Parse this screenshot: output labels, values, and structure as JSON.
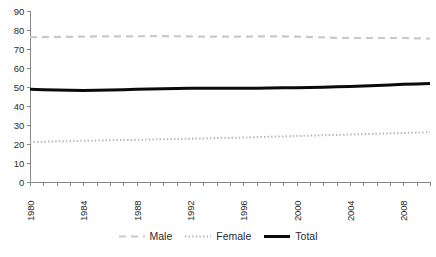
{
  "chart_data": {
    "type": "line",
    "title": "",
    "xlabel": "",
    "ylabel": "",
    "ylim": [
      0,
      90
    ],
    "xlim": [
      1980,
      2010
    ],
    "grid": false,
    "legend_position": "bottom",
    "ytick_labels": [
      "90",
      "80",
      "70",
      "60",
      "50",
      "40",
      "30",
      "20",
      "10",
      "0"
    ],
    "ytick_values": [
      90,
      80,
      70,
      60,
      50,
      40,
      30,
      20,
      10,
      0
    ],
    "x": [
      1980,
      1981,
      1982,
      1983,
      1984,
      1985,
      1986,
      1987,
      1988,
      1989,
      1990,
      1991,
      1992,
      1993,
      1994,
      1995,
      1996,
      1997,
      1998,
      1999,
      2000,
      2001,
      2002,
      2003,
      2004,
      2005,
      2006,
      2007,
      2008,
      2009,
      2010
    ],
    "xtick_labels": [
      "1980",
      "1984",
      "1988",
      "1992",
      "1996",
      "2000",
      "2004",
      "2008"
    ],
    "xtick_label_values": [
      1980,
      1984,
      1988,
      1992,
      1996,
      2000,
      2004,
      2008
    ],
    "xtick_rotation": 90,
    "series": [
      {
        "name": "Male",
        "style": "dashed",
        "color": "#c9c9c9",
        "width": 2.2,
        "values": [
          76.2,
          76.3,
          76.4,
          76.4,
          76.5,
          76.6,
          76.6,
          76.6,
          76.7,
          76.8,
          76.8,
          76.7,
          76.6,
          76.5,
          76.5,
          76.5,
          76.5,
          76.6,
          76.6,
          76.6,
          76.5,
          76.3,
          76.1,
          75.9,
          75.8,
          75.8,
          75.8,
          75.8,
          75.8,
          75.6,
          75.5
        ]
      },
      {
        "name": "Female",
        "style": "dotted",
        "color": "#b5b5b5",
        "width": 2.0,
        "values": [
          21.0,
          21.2,
          21.4,
          21.5,
          21.7,
          21.8,
          22.0,
          22.1,
          22.2,
          22.4,
          22.5,
          22.6,
          22.8,
          22.9,
          23.1,
          23.2,
          23.4,
          23.6,
          23.8,
          24.0,
          24.2,
          24.4,
          24.6,
          24.8,
          25.0,
          25.2,
          25.4,
          25.6,
          25.8,
          26.0,
          26.2
        ]
      },
      {
        "name": "Total",
        "style": "solid",
        "color": "#0a0a0a",
        "width": 3.0,
        "values": [
          48.8,
          48.6,
          48.4,
          48.3,
          48.2,
          48.3,
          48.4,
          48.6,
          48.8,
          49.0,
          49.1,
          49.2,
          49.3,
          49.3,
          49.3,
          49.3,
          49.3,
          49.4,
          49.5,
          49.6,
          49.6,
          49.7,
          49.9,
          50.1,
          50.3,
          50.5,
          50.8,
          51.1,
          51.4,
          51.6,
          51.8
        ]
      }
    ]
  },
  "legend": {
    "items": [
      {
        "label": "Male",
        "icon": "dashed-line-swatch"
      },
      {
        "label": "Female",
        "icon": "dotted-line-swatch"
      },
      {
        "label": "Total",
        "icon": "solid-line-swatch"
      }
    ]
  },
  "axis_colors": {
    "axis_line": "#8a8a8a",
    "tick_text": "#2b2b2b"
  }
}
